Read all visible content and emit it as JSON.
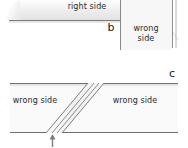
{
  "figure": {
    "colors": {
      "fabric_fill": "#f2f2f2",
      "panel_fill": "#e6e6e6",
      "outline": "#6e6e6e",
      "light_outline": "#bfbfbf",
      "text": "#2b2b2b",
      "background": "#ffffff"
    },
    "panels": [
      {
        "id": "b",
        "letter": "b",
        "regions": [
          {
            "name": "right-side-region",
            "label": "right side"
          },
          {
            "name": "wrong-side-region",
            "label": "wrong side"
          }
        ]
      },
      {
        "id": "c",
        "letter": "c",
        "regions": [
          {
            "name": "wrong-side-left-region",
            "label": "wrong side"
          },
          {
            "name": "wrong-side-right-region",
            "label": "wrong side"
          }
        ]
      }
    ],
    "labels": {
      "right_side": "right side",
      "wrong_side_b": "wrong side",
      "wrong_side_left": "wrong side",
      "wrong_side_right": "wrong side",
      "panel_letter_b": "b",
      "panel_letter_c": "c"
    },
    "annotations": {
      "arrow_up": "arrow pointing up at seam line"
    }
  }
}
